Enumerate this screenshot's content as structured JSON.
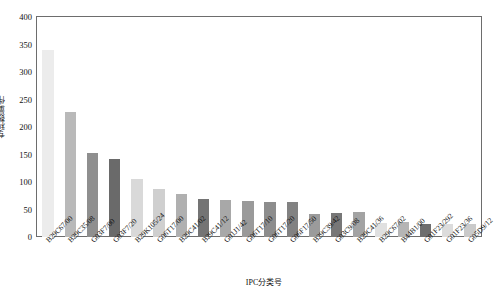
{
  "chart_data": {
    "type": "bar",
    "title": "",
    "xlabel": "IPC分类号",
    "ylabel": "专利数量/件",
    "ylim": [
      0,
      400
    ],
    "yticks": [
      0,
      50,
      100,
      150,
      200,
      250,
      300,
      350,
      400
    ],
    "grid": false,
    "legend": "none",
    "categories": [
      "B29C67/00",
      "B29C35/08",
      "G03F7/00",
      "G03F7/20",
      "B29K105/24",
      "G06T17/00",
      "B29C41/02",
      "B29C41/12",
      "G01J1/42",
      "G06T17/10",
      "G06T17/20",
      "G06F17/50",
      "B29C39/42",
      "G03C9/08",
      "B29C41/36",
      "B29C67/02",
      "B44B1/00",
      "G01F23/292",
      "G01F23/36",
      "G05D9/12"
    ],
    "values": [
      340,
      227,
      152,
      141,
      106,
      87,
      79,
      70,
      68,
      65,
      64,
      63,
      42,
      43,
      46,
      26,
      28,
      24,
      24,
      23
    ],
    "bar_colors": [
      "#ececec",
      "#b9b9b9",
      "#8f8f8f",
      "#6a6a6a",
      "#d9d9d9",
      "#cfcfcf",
      "#b0b0b0",
      "#747474",
      "#a8a8a8",
      "#9a9a9a",
      "#8d8d8d",
      "#828282",
      "#9b9b9b",
      "#777777",
      "#a3a3a3",
      "#e0e0e0",
      "#b5b5b5",
      "#6e6e6e",
      "#dcdcdc",
      "#cacaca",
      "#8a8a8a"
    ],
    "axis_color": "#6d6d6d"
  }
}
